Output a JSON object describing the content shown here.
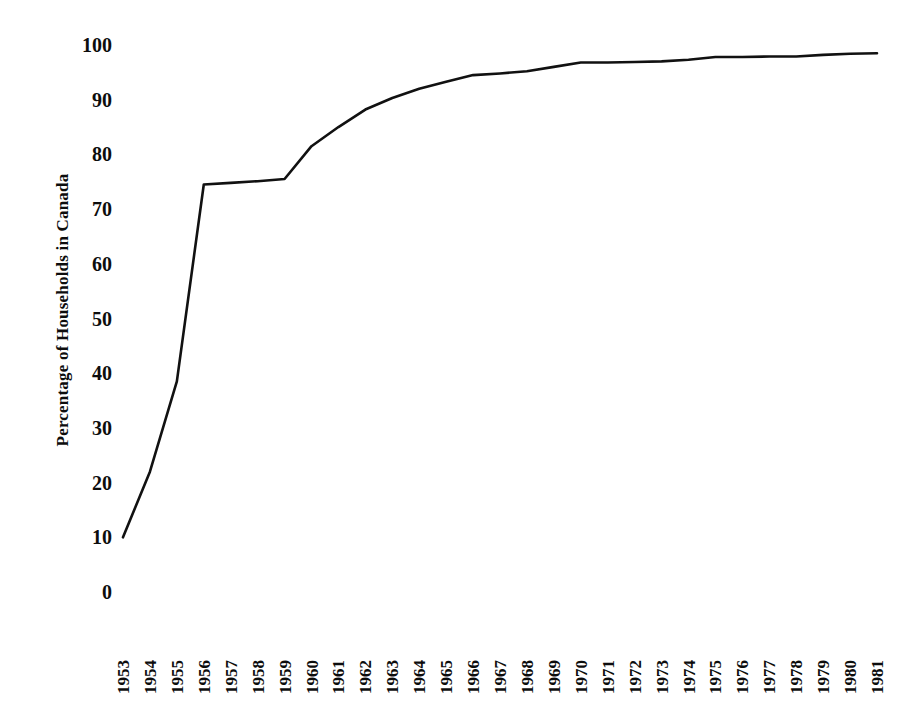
{
  "chart_data": {
    "type": "line",
    "title": "",
    "xlabel": "",
    "ylabel": "Percentage of Households in Canada",
    "ylim": [
      0,
      100
    ],
    "yticks": [
      0,
      10,
      20,
      30,
      40,
      50,
      60,
      70,
      80,
      90,
      100
    ],
    "ytick_labels": [
      "0",
      "10",
      "20",
      "30",
      "40",
      "50",
      "60",
      "70",
      "80",
      "90",
      "100"
    ],
    "grid": false,
    "legend": "none",
    "line_color": "#111111",
    "background_color": "#ffffff",
    "categories": [
      "1953",
      "1954",
      "1955",
      "1956",
      "1957",
      "1958",
      "1959",
      "1960",
      "1961",
      "1962",
      "1963",
      "1964",
      "1965",
      "1966",
      "1967",
      "1968",
      "1969",
      "1970",
      "1971",
      "1972",
      "1973",
      "1974",
      "1975",
      "1976",
      "1977",
      "1978",
      "1979",
      "1980",
      "1981"
    ],
    "x": [
      1953,
      1954,
      1955,
      1956,
      1957,
      1958,
      1959,
      1960,
      1961,
      1962,
      1963,
      1964,
      1965,
      1966,
      1967,
      1968,
      1969,
      1970,
      1971,
      1972,
      1973,
      1974,
      1975,
      1976,
      1977,
      1978,
      1979,
      1980,
      1981
    ],
    "values": [
      10.0,
      22.0,
      38.5,
      74.5,
      74.8,
      75.1,
      75.5,
      81.5,
      85.0,
      88.2,
      90.3,
      92.0,
      93.3,
      94.5,
      94.8,
      95.2,
      96.0,
      96.8,
      96.8,
      96.9,
      97.0,
      97.3,
      97.8,
      97.8,
      97.9,
      97.9,
      98.2,
      98.4,
      98.5
    ],
    "series": [
      {
        "name": "Percentage of Households in Canada",
        "values": [
          10.0,
          22.0,
          38.5,
          74.5,
          74.8,
          75.1,
          75.5,
          81.5,
          85.0,
          88.2,
          90.3,
          92.0,
          93.3,
          94.5,
          94.8,
          95.2,
          96.0,
          96.8,
          96.8,
          96.9,
          97.0,
          97.3,
          97.8,
          97.8,
          97.9,
          97.9,
          98.2,
          98.4,
          98.5
        ]
      }
    ]
  },
  "axes": {
    "y_axis_title": "Percentage of Households in Canada"
  }
}
